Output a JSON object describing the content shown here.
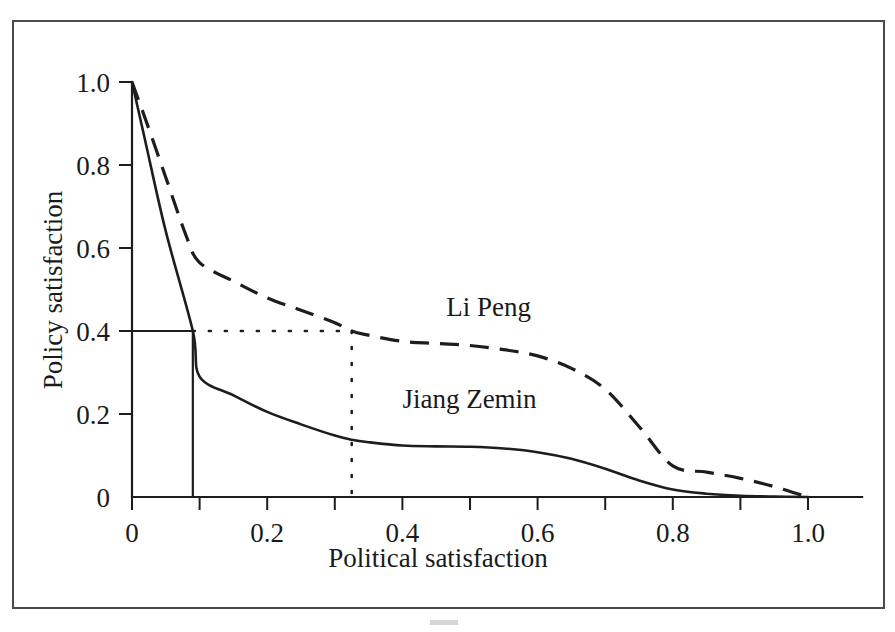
{
  "figure": {
    "background_color": "#ffffff",
    "frame_color": "#4a4a4a",
    "ink_color": "#1d1d1d"
  },
  "chart_data": {
    "type": "line",
    "title": "",
    "xlabel": "Political satisfaction",
    "ylabel": "Policy satisfaction",
    "xlim": [
      0,
      1.08
    ],
    "ylim": [
      0,
      1.0
    ],
    "grid": false,
    "legend_position": "inline-annotation",
    "x_ticks_major": [
      0,
      0.2,
      0.4,
      0.6,
      0.8,
      1.0
    ],
    "x_tick_labels": [
      "0",
      "0.2",
      "0.4",
      "0.6",
      "0.8",
      "1.0"
    ],
    "x_ticks_minor": [
      0.1,
      0.3,
      0.5,
      0.7,
      0.9
    ],
    "y_ticks_major": [
      0,
      0.2,
      0.4,
      0.6,
      0.8,
      1.0
    ],
    "y_tick_labels": [
      "0",
      "0.2",
      "0.4",
      "0.6",
      "0.8",
      "1.0"
    ],
    "series": [
      {
        "name": "Li Peng",
        "style": "dashed",
        "label": "Li Peng",
        "x": [
          0.0,
          0.02,
          0.05,
          0.08,
          0.1,
          0.15,
          0.2,
          0.25,
          0.3,
          0.325,
          0.35,
          0.4,
          0.45,
          0.5,
          0.55,
          0.6,
          0.65,
          0.7,
          0.75,
          0.8,
          0.85,
          0.9,
          0.95,
          1.0
        ],
        "y": [
          1.0,
          0.91,
          0.77,
          0.63,
          0.565,
          0.52,
          0.48,
          0.45,
          0.42,
          0.4,
          0.39,
          0.375,
          0.37,
          0.365,
          0.355,
          0.34,
          0.31,
          0.26,
          0.17,
          0.075,
          0.06,
          0.045,
          0.025,
          0.0
        ]
      },
      {
        "name": "Jiang Zemin",
        "style": "solid",
        "label": "Jiang Zemin",
        "x": [
          0.0,
          0.02,
          0.05,
          0.09,
          0.1,
          0.15,
          0.2,
          0.25,
          0.3,
          0.325,
          0.35,
          0.4,
          0.45,
          0.5,
          0.55,
          0.6,
          0.65,
          0.7,
          0.75,
          0.8,
          0.85,
          0.9,
          0.95,
          1.0
        ],
        "y": [
          1.0,
          0.855,
          0.64,
          0.4,
          0.29,
          0.245,
          0.205,
          0.175,
          0.148,
          0.138,
          0.132,
          0.124,
          0.122,
          0.121,
          0.117,
          0.108,
          0.092,
          0.068,
          0.04,
          0.018,
          0.008,
          0.003,
          0.001,
          0.0
        ]
      }
    ],
    "annotations": [
      {
        "name": "solid-guide-horizontal",
        "style": "solid",
        "from": [
          0.0,
          0.4
        ],
        "to": [
          0.09,
          0.4
        ]
      },
      {
        "name": "solid-guide-vertical",
        "style": "solid",
        "from": [
          0.09,
          0.4
        ],
        "to": [
          0.09,
          0.0
        ]
      },
      {
        "name": "dotted-guide-horizontal",
        "style": "dotted",
        "from": [
          0.09,
          0.4
        ],
        "to": [
          0.325,
          0.4
        ]
      },
      {
        "name": "dotted-guide-vertical",
        "style": "dotted",
        "from": [
          0.325,
          0.4
        ],
        "to": [
          0.325,
          0.0
        ]
      }
    ],
    "series_label_positions": [
      {
        "label": "Li Peng",
        "x": 0.465,
        "y": 0.435
      },
      {
        "label": "Jiang Zemin",
        "x": 0.4,
        "y": 0.215
      }
    ]
  }
}
